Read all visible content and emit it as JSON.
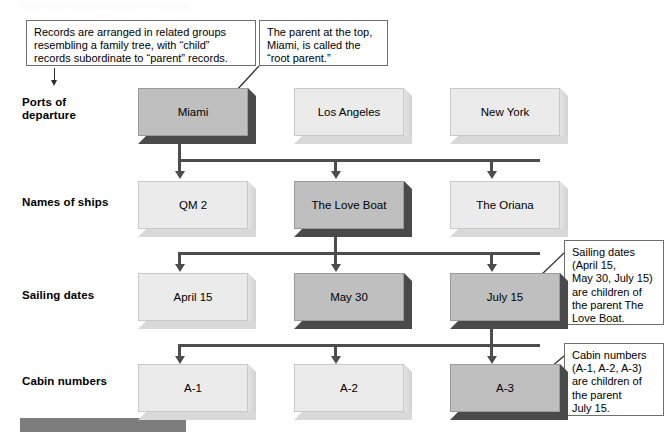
{
  "diagram": {
    "type": "hierarchical-tree",
    "accent_dark": "#4a4a4a",
    "node_light": "#ebebeb",
    "node_dark": "#bfbfbf",
    "connector_color": "#4d4d4d"
  },
  "row_labels": [
    {
      "id": "ports",
      "text_line1": "Ports of",
      "text_line2": "departure"
    },
    {
      "id": "ships",
      "text_line1": "Names of ships",
      "text_line2": ""
    },
    {
      "id": "dates",
      "text_line1": "Sailing dates",
      "text_line2": ""
    },
    {
      "id": "cabins",
      "text_line1": "Cabin numbers",
      "text_line2": ""
    }
  ],
  "rows": [
    {
      "id": "ports-of-departure",
      "label": "Ports of departure",
      "nodes": [
        {
          "label": "Miami",
          "highlighted": true
        },
        {
          "label": "Los Angeles",
          "highlighted": false
        },
        {
          "label": "New York",
          "highlighted": false
        }
      ]
    },
    {
      "id": "names-of-ships",
      "label": "Names of ships",
      "nodes": [
        {
          "label": "QM 2",
          "highlighted": false
        },
        {
          "label": "The Love Boat",
          "highlighted": true
        },
        {
          "label": "The Oriana",
          "highlighted": false
        }
      ]
    },
    {
      "id": "sailing-dates",
      "label": "Sailing dates",
      "nodes": [
        {
          "label": "April 15",
          "highlighted": false
        },
        {
          "label": "May 30",
          "highlighted": true
        },
        {
          "label": "July 15",
          "highlighted": true
        }
      ]
    },
    {
      "id": "cabin-numbers",
      "label": "Cabin numbers",
      "nodes": [
        {
          "label": "A-1",
          "highlighted": false
        },
        {
          "label": "A-2",
          "highlighted": false
        },
        {
          "label": "A-3",
          "highlighted": true
        }
      ]
    }
  ],
  "callouts": [
    {
      "id": "records-arrangement",
      "lines": [
        "Records are arranged in related groups",
        "resembling a family tree, with “child”",
        "records subordinate to “parent” records."
      ]
    },
    {
      "id": "root-parent",
      "lines": [
        "The parent at the top,",
        "Miami, is called the",
        "“root parent.”"
      ]
    },
    {
      "id": "sailing-dates-children",
      "lines": [
        "Sailing dates",
        "(April 15,",
        "May 30, July 15)",
        "are children of",
        "the parent The",
        "Love Boat."
      ]
    },
    {
      "id": "cabin-numbers-children",
      "lines": [
        "Cabin numbers",
        "(A-1, A-2, A-3)",
        "are children of",
        "the parent",
        "July 15."
      ]
    }
  ]
}
